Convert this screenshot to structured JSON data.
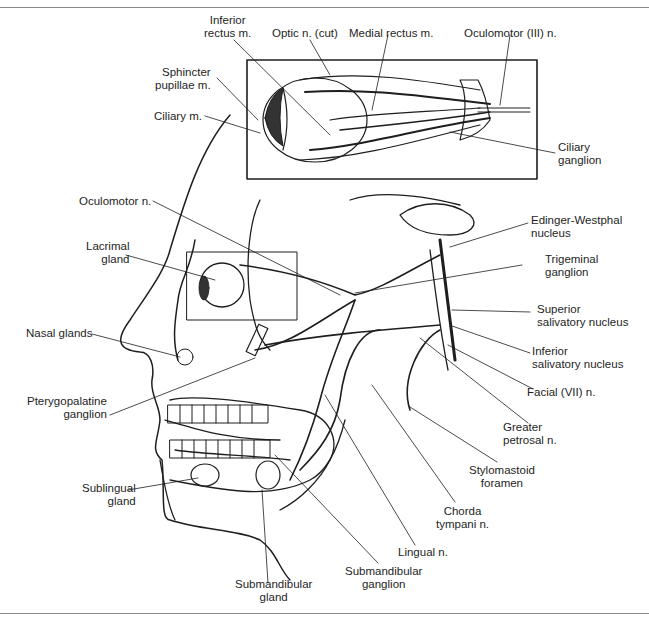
{
  "figure": {
    "inset": {
      "labels": {
        "inferior_rectus": "Inferior\nrectus m.",
        "optic_nerve": "Optic n. (cut)",
        "medial_rectus": "Medial rectus m.",
        "oculomotor_III": "Oculomotor (III) n.",
        "sphincter_pupillae": "Sphincter\npupillae m.",
        "ciliary_muscle": "Ciliary m.",
        "ciliary_ganglion": "Ciliary\nganglion"
      }
    },
    "main": {
      "labels": {
        "oculomotor_n": "Oculomotor n.",
        "lacrimal_gland": "Lacrimal\ngland",
        "nasal_glands": "Nasal glands",
        "pterygopalatine_ganglion": "Pterygopalatine\nganglion",
        "sublingual_gland": "Sublingual\ngland",
        "submandibular_gland": "Submandibular\ngland",
        "submandibular_ganglion": "Submandibular\nganglion",
        "lingual_n": "Lingual n.",
        "chorda_tympani": "Chorda\ntympani n.",
        "stylomastoid_foramen": "Stylomastoid\nforamen",
        "greater_petrosal": "Greater\npetrosal n.",
        "facial_VII": "Facial (VII) n.",
        "inferior_salivatory": "Inferior\nsalivatory nucleus",
        "superior_salivatory": "Superior\nsalivatory nucleus",
        "trigeminal_ganglion": "Trigeminal\nganglion",
        "edinger_westphal": "Edinger-Westphal\nnucleus"
      }
    },
    "colors": {
      "ink": "#1e1e1e",
      "rule": "#8a8a8a",
      "background": "#ffffff"
    }
  }
}
